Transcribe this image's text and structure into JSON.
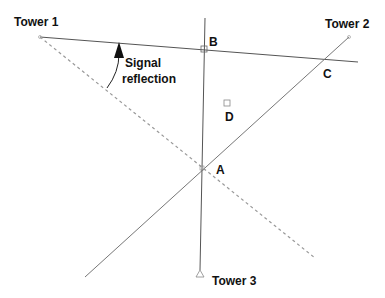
{
  "diagram": {
    "towers": [
      {
        "id": "tower1",
        "label": "Tower 1",
        "x": 40,
        "y": 37
      },
      {
        "id": "tower2",
        "label": "Tower 2",
        "x": 349,
        "y": 37
      },
      {
        "id": "tower3",
        "label": "Tower 3",
        "x": 201,
        "y": 272
      }
    ],
    "points": [
      {
        "id": "A",
        "label": "A"
      },
      {
        "id": "B",
        "label": "B"
      },
      {
        "id": "C",
        "label": "C"
      },
      {
        "id": "D",
        "label": "D"
      }
    ],
    "annotation": {
      "line1": "Signal",
      "line2": "reflection"
    },
    "colors": {
      "solid_line": "#555555",
      "dashed_line": "#888888",
      "text": "#111111"
    }
  }
}
